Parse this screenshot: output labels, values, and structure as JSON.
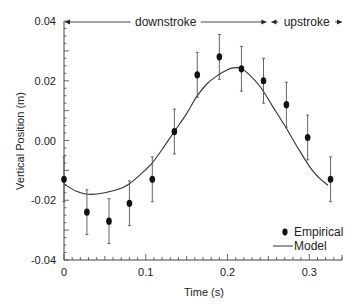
{
  "chart_data": {
    "type": "scatter",
    "title": "",
    "xlabel": "Time (s)",
    "ylabel": "Vertical Position (m)",
    "xlim": [
      0,
      0.34
    ],
    "ylim": [
      -0.04,
      0.04
    ],
    "grid": false,
    "x_ticks": [
      {
        "value": 0,
        "label": "0"
      },
      {
        "value": 0.1,
        "label": "0.1"
      },
      {
        "value": 0.2,
        "label": "0.2"
      },
      {
        "value": 0.3,
        "label": "0.3"
      }
    ],
    "y_ticks": [
      {
        "value": 0.04,
        "label": "0.04"
      },
      {
        "value": 0.02,
        "label": "0.02"
      },
      {
        "value": 0.0,
        "label": "0.00"
      },
      {
        "value": -0.02,
        "label": "-0.02"
      },
      {
        "value": -0.04,
        "label": "-0.04"
      }
    ],
    "x_minor_step": 0.01,
    "y_minor_step": 0.0025,
    "series": [
      {
        "name": "Empirical",
        "kind": "points-with-error-bars",
        "color": "#111111",
        "x": [
          0.0,
          0.028,
          0.055,
          0.08,
          0.108,
          0.135,
          0.163,
          0.19,
          0.217,
          0.244,
          0.272,
          0.298,
          0.326
        ],
        "y": [
          -0.013,
          -0.024,
          -0.027,
          -0.021,
          -0.013,
          0.003,
          0.022,
          0.028,
          0.024,
          0.02,
          0.012,
          0.001,
          -0.013
        ],
        "yerr": [
          0.0075,
          0.0075,
          0.0075,
          0.0075,
          0.0075,
          0.0075,
          0.0075,
          0.0075,
          0.0075,
          0.0075,
          0.0075,
          0.0075,
          0.0075
        ]
      },
      {
        "name": "Model",
        "kind": "line",
        "color": "#333333",
        "x": [
          0.0,
          0.015,
          0.03,
          0.05,
          0.07,
          0.08,
          0.095,
          0.108,
          0.12,
          0.135,
          0.15,
          0.162,
          0.175,
          0.189,
          0.2,
          0.207,
          0.216,
          0.225,
          0.24,
          0.255,
          0.271,
          0.285,
          0.301,
          0.312,
          0.323
        ],
        "y": [
          -0.0145,
          -0.017,
          -0.018,
          -0.0175,
          -0.016,
          -0.0145,
          -0.011,
          -0.0075,
          -0.003,
          0.003,
          0.009,
          0.0146,
          0.019,
          0.022,
          0.0237,
          0.0243,
          0.0242,
          0.0225,
          0.018,
          0.0115,
          0.0045,
          -0.002,
          -0.009,
          -0.0125,
          -0.015
        ]
      }
    ],
    "annotations": [
      {
        "text": "downstroke",
        "x_range": [
          0,
          0.25
        ],
        "y": 0.04,
        "style": "double-arrow"
      },
      {
        "text": "upstroke",
        "x_range": [
          0.25,
          0.34
        ],
        "y": 0.04,
        "style": "double-arrow"
      }
    ],
    "legend": {
      "position": "bottom-right",
      "entries": [
        {
          "label": "Empirical",
          "marker": "dot"
        },
        {
          "label": "Model",
          "marker": "line"
        }
      ]
    }
  }
}
